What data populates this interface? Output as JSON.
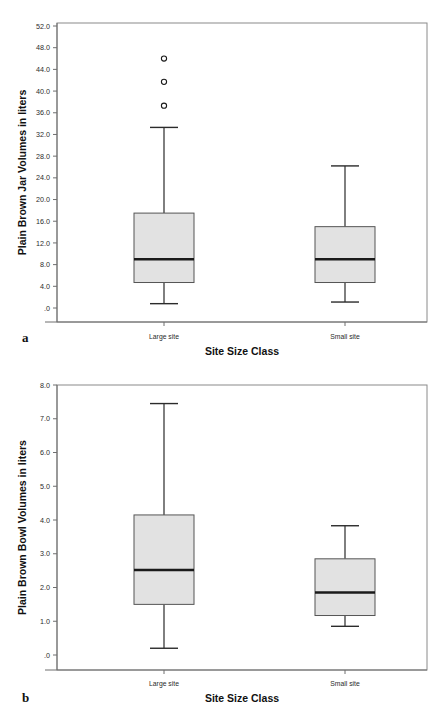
{
  "figure": {
    "panels": [
      {
        "panel_label": "a",
        "chart_data": {
          "type": "box",
          "title": "",
          "xlabel": "Site Size Class",
          "ylabel": "Plain Brown Jar Volumes in liters",
          "categories": [
            "Large site",
            "Small site"
          ],
          "ylim": [
            0,
            52
          ],
          "ytick_step": 4,
          "yticks": [
            0,
            4,
            8,
            12,
            16,
            20,
            24,
            28,
            32,
            36,
            40,
            44,
            48,
            52
          ],
          "ytick_labels": [
            ".0",
            "4.0",
            "8.0",
            "12.0",
            "16.0",
            "20.0",
            "24.0",
            "28.0",
            "32.0",
            "36.0",
            "40.0",
            "44.0",
            "48.0",
            "52.0"
          ],
          "grid": false,
          "legend": "none",
          "boxes": [
            {
              "category": "Large site",
              "whisker_low": 0.8,
              "q1": 4.7,
              "median": 9.0,
              "q3": 17.5,
              "whisker_high": 33.3,
              "outliers": [
                37.3,
                41.7,
                46.0
              ]
            },
            {
              "category": "Small site",
              "whisker_low": 1.1,
              "q1": 4.7,
              "median": 9.0,
              "q3": 15.0,
              "whisker_high": 26.2,
              "outliers": []
            }
          ]
        }
      },
      {
        "panel_label": "b",
        "chart_data": {
          "type": "box",
          "title": "",
          "xlabel": "Site Size Class",
          "ylabel": "Plain Brown Bowl Volumes in liters",
          "categories": [
            "Large site",
            "Small site"
          ],
          "ylim": [
            0,
            8
          ],
          "ytick_step": 1,
          "yticks": [
            0,
            1,
            2,
            3,
            4,
            5,
            6,
            7,
            8
          ],
          "ytick_labels": [
            ".0",
            "1.0",
            "2.0",
            "3.0",
            "4.0",
            "5.0",
            "6.0",
            "7.0",
            "8.0"
          ],
          "grid": false,
          "legend": "none",
          "boxes": [
            {
              "category": "Large site",
              "whisker_low": 0.2,
              "q1": 1.5,
              "median": 2.52,
              "q3": 4.15,
              "whisker_high": 7.45,
              "outliers": []
            },
            {
              "category": "Small site",
              "whisker_low": 0.85,
              "q1": 1.17,
              "median": 1.85,
              "q3": 2.85,
              "whisker_high": 3.83,
              "outliers": []
            }
          ]
        }
      }
    ],
    "colors": {
      "box_fill": "#e2e2e2",
      "box_stroke": "#555555",
      "median": "#1a1a1a",
      "frame": "#8a8a8a",
      "text": "#1a1a1a",
      "background": "#ffffff"
    }
  }
}
